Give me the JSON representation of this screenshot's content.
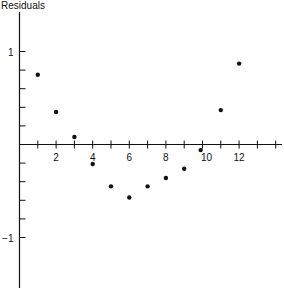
{
  "chart_data": {
    "type": "scatter",
    "title": "",
    "xlabel": "",
    "ylabel": "Residuals",
    "xlim": [
      0,
      14.5
    ],
    "ylim": [
      -1.5,
      1.4
    ],
    "x_ticks": [
      1,
      2,
      3,
      4,
      5,
      6,
      7,
      8,
      9,
      10,
      11,
      12,
      13,
      14
    ],
    "x_tick_labels": {
      "2": "2",
      "4": "4",
      "6": "6",
      "8": "8",
      "10": "10",
      "12": "12"
    },
    "y_ticks": [
      -1.0,
      -0.8,
      -0.6,
      -0.4,
      -0.2,
      0.2,
      0.4,
      0.6,
      0.8,
      1.0
    ],
    "y_tick_labels": {
      "1": "1",
      "-1": "−1"
    },
    "grid": false,
    "legend": null,
    "series": [
      {
        "name": "Residuals",
        "x": [
          1,
          2,
          3,
          4,
          5,
          6,
          7,
          8,
          9,
          9.9,
          11,
          12
        ],
        "y": [
          0.75,
          0.35,
          0.08,
          -0.21,
          -0.45,
          -0.57,
          -0.45,
          -0.36,
          -0.26,
          -0.06,
          0.37,
          0.87
        ]
      }
    ]
  },
  "labels": {
    "y_axis_title": "Residuals"
  },
  "colors": {
    "ink": "#111111",
    "background": "#ffffff"
  }
}
